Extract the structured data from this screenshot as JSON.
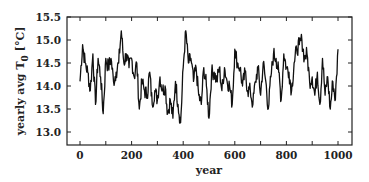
{
  "chart_data": {
    "type": "line",
    "title": "",
    "xlabel": "year",
    "ylabel": "yearly avg T0 [°C]",
    "ylabel_parts": {
      "pre": "yearly avg T",
      "sub": "0",
      "post": " [°C]"
    },
    "xlim": [
      -20,
      1050
    ],
    "ylim": [
      12.8,
      15.5
    ],
    "x_ticks": [
      0,
      200,
      400,
      600,
      800,
      1000
    ],
    "x_minor_ticks": [
      100,
      300,
      500,
      700,
      900
    ],
    "y_ticks": [
      13.0,
      13.5,
      14.0,
      14.5,
      15.0,
      15.5
    ],
    "y_tick_labels": [
      "13.0",
      "13.5",
      "14.0",
      "14.5",
      "15.0",
      "15.5"
    ],
    "grid": false,
    "legend": null,
    "line_color": "#111111",
    "series": [
      {
        "name": "yearly avg T0",
        "x": [
          0,
          10,
          20,
          30,
          40,
          50,
          60,
          70,
          80,
          90,
          100,
          110,
          120,
          130,
          140,
          150,
          160,
          170,
          180,
          190,
          200,
          210,
          220,
          230,
          240,
          250,
          260,
          270,
          280,
          290,
          300,
          310,
          320,
          330,
          340,
          350,
          360,
          370,
          380,
          390,
          400,
          410,
          420,
          430,
          440,
          450,
          460,
          470,
          480,
          490,
          500,
          510,
          520,
          530,
          540,
          550,
          560,
          570,
          580,
          590,
          600,
          610,
          620,
          630,
          640,
          650,
          660,
          670,
          680,
          690,
          700,
          710,
          720,
          730,
          740,
          750,
          760,
          770,
          780,
          790,
          800,
          810,
          820,
          830,
          840,
          850,
          860,
          870,
          880,
          890,
          900,
          910,
          920,
          930,
          940,
          950,
          960,
          970,
          980,
          990,
          1000
        ],
        "values": [
          14.1,
          14.9,
          14.5,
          14.3,
          13.9,
          14.7,
          13.6,
          14.6,
          14.2,
          13.4,
          14.6,
          14.4,
          14.6,
          14.1,
          14.3,
          14.5,
          15.2,
          14.5,
          14.7,
          14.4,
          14.6,
          14.2,
          14.5,
          13.5,
          14.1,
          13.9,
          13.8,
          14.3,
          13.6,
          13.9,
          13.7,
          14.2,
          13.9,
          14.0,
          13.4,
          13.7,
          13.3,
          14.1,
          13.6,
          13.2,
          14.4,
          15.2,
          14.5,
          14.6,
          14.1,
          14.4,
          13.8,
          13.6,
          14.4,
          14.0,
          13.3,
          14.3,
          14.3,
          14.1,
          14.4,
          13.9,
          14.4,
          14.1,
          14.0,
          13.6,
          14.8,
          14.5,
          14.4,
          14.0,
          14.3,
          13.9,
          13.9,
          13.6,
          14.1,
          14.4,
          13.8,
          14.5,
          14.1,
          13.5,
          14.2,
          14.7,
          14.6,
          14.3,
          13.7,
          14.7,
          14.4,
          14.3,
          13.9,
          14.5,
          14.8,
          14.9,
          15.0,
          14.6,
          14.7,
          14.1,
          14.2,
          13.8,
          14.3,
          13.6,
          14.6,
          13.8,
          14.2,
          13.5,
          14.1,
          13.7,
          14.8
        ]
      }
    ]
  }
}
